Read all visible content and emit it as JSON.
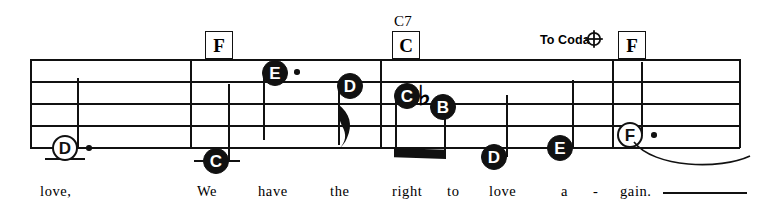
{
  "sheet": {
    "title": "music-staff-system",
    "clef_system": "single 5-line staff, guitar/vocal lead sheet"
  },
  "staff": {
    "left": 30,
    "right": 740,
    "line_tops": [
      59,
      81,
      103,
      125,
      147
    ],
    "barlines": [
      30,
      190,
      380,
      612,
      740
    ]
  },
  "chords": [
    {
      "id": "chord-1",
      "label": "F",
      "superscript": "",
      "x": 205,
      "y": 31
    },
    {
      "id": "chord-2",
      "label": "C",
      "superscript": "C7",
      "x": 392,
      "y": 31
    },
    {
      "id": "chord-3",
      "label": "F",
      "superscript": "",
      "x": 618,
      "y": 31
    }
  ],
  "markings": {
    "to_coda_label": "To Coda",
    "to_coda_x": 540,
    "to_coda_y": 33,
    "coda_symbol_name": "coda-symbol"
  },
  "notes": [
    {
      "id": "note-1",
      "pitch": "D",
      "head": "open",
      "dotted": true,
      "x": 52,
      "y": 135,
      "ledger": true,
      "stem": "up",
      "flag": false
    },
    {
      "id": "note-2",
      "pitch": "C",
      "head": "filled",
      "dotted": false,
      "x": 203,
      "y": 148,
      "ledger": true,
      "stem": "up",
      "flag": false
    },
    {
      "id": "note-3",
      "pitch": "E",
      "head": "filled",
      "dotted": true,
      "x": 262,
      "y": 60,
      "ledger": false,
      "stem": "down",
      "flag": false
    },
    {
      "id": "note-4",
      "pitch": "D",
      "head": "filled",
      "dotted": false,
      "x": 337,
      "y": 73,
      "ledger": false,
      "stem": "down",
      "flag": true
    },
    {
      "id": "note-5",
      "pitch": "C",
      "head": "filled",
      "dotted": false,
      "x": 394,
      "y": 83,
      "ledger": false,
      "stem": "down",
      "flag": false,
      "beamed": true
    },
    {
      "id": "note-6",
      "pitch": "B",
      "head": "filled",
      "dotted": false,
      "x": 430,
      "y": 94,
      "ledger": false,
      "stem": "down",
      "flag": false,
      "beamed": true,
      "accidental": "flat"
    },
    {
      "id": "note-7",
      "pitch": "D",
      "head": "filled",
      "dotted": false,
      "x": 481,
      "y": 144,
      "ledger": false,
      "stem": "up",
      "flag": false
    },
    {
      "id": "note-8",
      "pitch": "E",
      "head": "filled",
      "dotted": false,
      "x": 547,
      "y": 135,
      "ledger": false,
      "stem": "up",
      "flag": false
    },
    {
      "id": "note-9",
      "pitch": "F",
      "head": "open",
      "dotted": true,
      "x": 617,
      "y": 122,
      "ledger": false,
      "stem": "up",
      "flag": false,
      "tied": true
    }
  ],
  "lyrics": [
    {
      "id": "lyric-1",
      "text": "love,",
      "x": 40
    },
    {
      "id": "lyric-2",
      "text": "We",
      "x": 197
    },
    {
      "id": "lyric-3",
      "text": "have",
      "x": 258
    },
    {
      "id": "lyric-4",
      "text": "the",
      "x": 330
    },
    {
      "id": "lyric-5",
      "text": "right",
      "x": 392
    },
    {
      "id": "lyric-6",
      "text": "to",
      "x": 447
    },
    {
      "id": "lyric-7",
      "text": "love",
      "x": 489
    },
    {
      "id": "lyric-8",
      "text": "a",
      "x": 561
    },
    {
      "id": "lyric-9",
      "text": "-",
      "x": 593
    },
    {
      "id": "lyric-10",
      "text": "gain.",
      "x": 620
    }
  ],
  "lyric_extension": {
    "x": 663,
    "y": 192,
    "width": 84
  },
  "colors": {
    "ink": "#111111",
    "paper": "#ffffff"
  }
}
